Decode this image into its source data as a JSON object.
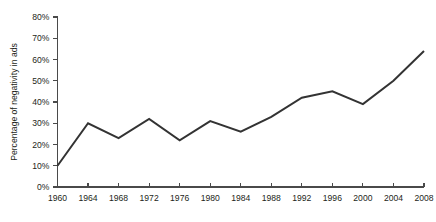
{
  "chart_data": {
    "type": "line",
    "title": "",
    "subtitle": "",
    "xlabel": "",
    "ylabel": "Percentage of negativity in ads",
    "x": [
      1960,
      1964,
      1968,
      1972,
      1976,
      1980,
      1984,
      1988,
      1992,
      1996,
      2000,
      2004,
      2008
    ],
    "values": [
      10,
      30,
      23,
      32,
      22,
      31,
      26,
      33,
      42,
      45,
      39,
      50,
      64
    ],
    "series": [
      {
        "name": "Percentage of negativity in ads",
        "values": [
          10,
          30,
          23,
          32,
          22,
          31,
          26,
          33,
          42,
          45,
          39,
          50,
          64
        ]
      }
    ],
    "categories": [
      "1960",
      "1964",
      "1968",
      "1972",
      "1976",
      "1980",
      "1984",
      "1988",
      "1992",
      "1996",
      "2000",
      "2004",
      "2008"
    ],
    "x_tick_labels": [
      "1960",
      "1964",
      "1968",
      "1972",
      "1976",
      "1980",
      "1984",
      "1988",
      "1992",
      "1996",
      "2000",
      "2004",
      "2008"
    ],
    "y_tick_values": [
      0,
      10,
      20,
      30,
      40,
      50,
      60,
      70,
      80
    ],
    "y_tick_labels": [
      "0%",
      "10%",
      "20%",
      "30%",
      "40%",
      "50%",
      "60%",
      "70%",
      "80%"
    ],
    "xlim": [
      1960,
      2008
    ],
    "ylim": [
      0,
      80
    ],
    "grid": false,
    "legend": false,
    "legend_position": "none",
    "annotations": [],
    "line_color": "#333333",
    "axis_color": "#4a4a4a",
    "background_color": "#ffffff",
    "text_color": "#231f20"
  }
}
